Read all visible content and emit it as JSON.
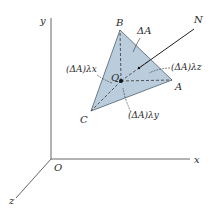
{
  "diagram": {
    "axes": {
      "x_label": "x",
      "y_label": "y",
      "z_label": "z",
      "origin_label": "O"
    },
    "triangle": {
      "vertices": {
        "A": "A",
        "B": "B",
        "C": "C"
      },
      "fill_color": "#b9cddc",
      "edge_color": "#5d6f7c"
    },
    "point_Q": "Q",
    "normal_label": "N",
    "area_label": "ΔA",
    "projections": {
      "x": "(ΔA)λx",
      "y": "(ΔA)λy",
      "z": "(ΔA)λz"
    }
  }
}
